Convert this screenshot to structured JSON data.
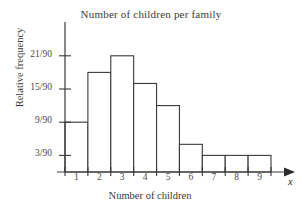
{
  "chart_data": {
    "type": "bar",
    "title": "Number of children per family",
    "xlabel": "Number of children",
    "ylabel": "Relative frequency",
    "axis_variable": "x",
    "categories": [
      "1",
      "2",
      "3",
      "4",
      "5",
      "6",
      "7",
      "8",
      "9"
    ],
    "values": [
      9,
      18,
      21,
      16,
      12,
      5,
      3,
      3,
      3
    ],
    "value_denominator": 90,
    "value_labels": [
      "9/90",
      "18/90",
      "21/90",
      "16/90",
      "12/90",
      "5/90",
      "3/90",
      "3/90",
      "3/90"
    ],
    "ytick_labels": [
      "3/90",
      "9/90",
      "15/90",
      "21/90"
    ],
    "ytick_values": [
      3,
      9,
      15,
      21
    ],
    "ylim": [
      0,
      23
    ],
    "xlim": [
      0.5,
      9.5
    ],
    "grid": false,
    "legend": null,
    "bar_fill": "#ffffff",
    "bar_edge": "#3a3a3a",
    "axis_color": "#3a3a3a"
  }
}
